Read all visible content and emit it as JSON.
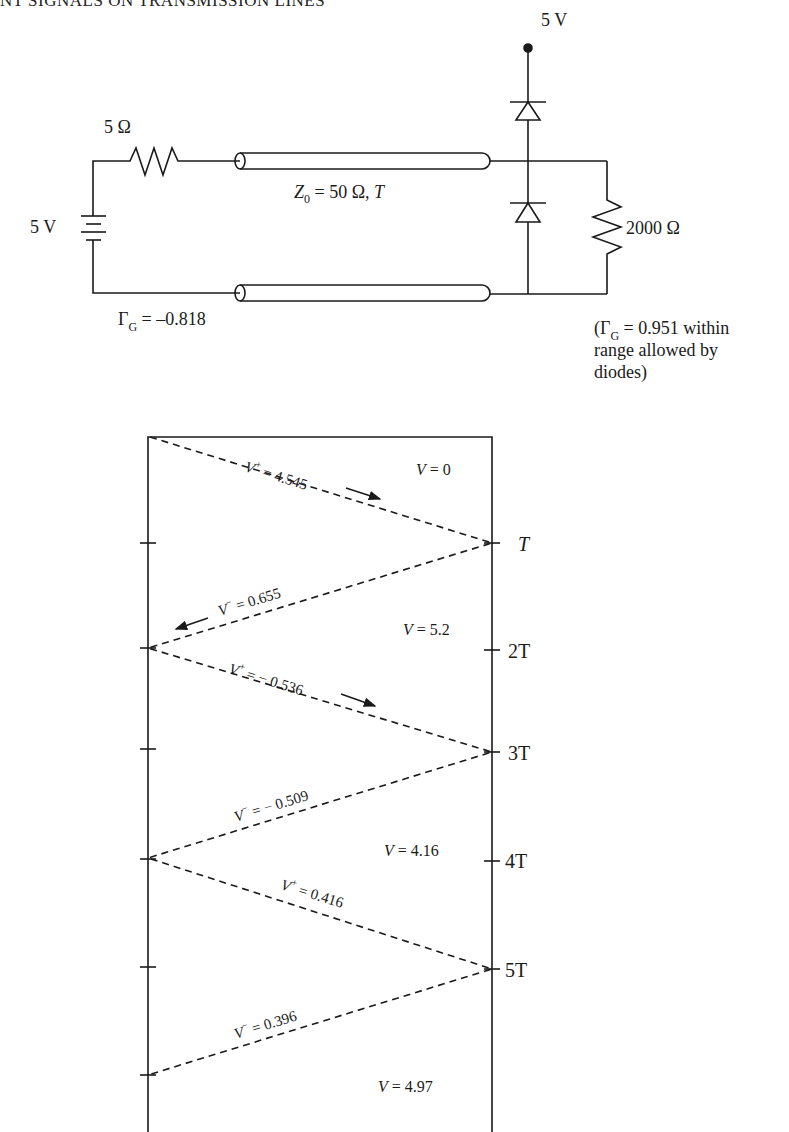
{
  "header": {
    "text": "NT SIGNALS ON TRANSMISSION LINES"
  },
  "circuit": {
    "source_voltage": "5 V",
    "source_resistance": "5 Ω",
    "line": {
      "z_symbol": "Z",
      "z_sub": "0",
      "z_rest": " = 50 Ω,  ",
      "delay": "T"
    },
    "supply_label": "5 V",
    "load_resistance": "2000 Ω",
    "gamma_source": {
      "symbol": "Γ",
      "sub": "G",
      "value": " = –0.818"
    },
    "gamma_load_note": {
      "line1_open": "(",
      "line1_symbol": "Γ",
      "line1_sub": "G",
      "line1_rest": " = 0.951 within",
      "line2": "range allowed by",
      "line3": "diodes)"
    }
  },
  "bounce_diagram": {
    "time_labels": [
      "T",
      "2T",
      "3T",
      "4T",
      "5T"
    ],
    "waves": [
      {
        "sym": "V",
        "sup": "+",
        "value": " = 4.545",
        "direction": "right"
      },
      {
        "sym": "V",
        "sup": "−",
        "value": " = 0.655",
        "direction": "left"
      },
      {
        "sym": "V",
        "sup": "+",
        "value": " = − 0.536",
        "direction": "right"
      },
      {
        "sym": "V",
        "sup": "−",
        "value": " = − 0.509",
        "direction": "left"
      },
      {
        "sym": "V",
        "sup": "+",
        "value": " = 0.416",
        "direction": "right"
      },
      {
        "sym": "V",
        "sup": "−",
        "value": " = 0.396",
        "direction": "left"
      }
    ],
    "load_voltages": [
      {
        "sym": "V",
        "value": " = 0"
      },
      {
        "sym": "V",
        "value": " = 5.2"
      },
      {
        "sym": "V",
        "value": " = 4.16"
      },
      {
        "sym": "V",
        "value": " = 4.97"
      }
    ]
  }
}
